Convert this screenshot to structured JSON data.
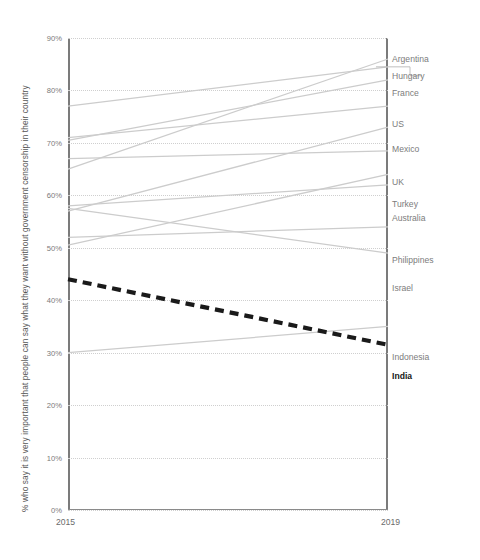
{
  "chart_data": {
    "type": "line",
    "subtype": "slope-chart",
    "title": "",
    "xlabel": "",
    "ylabel": "% who say it is very important that people can say what they want without government censorship in their country",
    "x": [
      "2015",
      "2019"
    ],
    "categories": [
      "2015",
      "2019"
    ],
    "ylim": [
      0,
      90
    ],
    "ytick_labels": [
      "0%",
      "10%",
      "20%",
      "30%",
      "40%",
      "50%",
      "60%",
      "70%",
      "80%",
      "90%"
    ],
    "ytick_values": [
      0,
      10,
      20,
      30,
      40,
      50,
      60,
      70,
      80,
      90
    ],
    "grid": true,
    "grid_style": "dotted",
    "legend": "right-labels",
    "line_color": "#cccccc",
    "highlight_color": "#1a1a1a",
    "series": [
      {
        "name": "Argentina",
        "values": [
          65,
          86
        ],
        "highlight": false
      },
      {
        "name": "Hungary",
        "values": [
          77,
          84.5
        ],
        "highlight": false
      },
      {
        "name": "France",
        "values": [
          70.5,
          82
        ],
        "highlight": false
      },
      {
        "name": "US",
        "values": [
          71,
          77
        ],
        "highlight": false
      },
      {
        "name": "Mexico",
        "values": [
          57,
          73
        ],
        "highlight": false
      },
      {
        "name": "UK",
        "values": [
          67,
          68.5
        ],
        "highlight": false
      },
      {
        "name": "Turkey",
        "values": [
          50.5,
          64
        ],
        "highlight": false
      },
      {
        "name": "Australia",
        "values": [
          58,
          62
        ],
        "highlight": false
      },
      {
        "name": "Philippines",
        "values": [
          52,
          54
        ],
        "highlight": false
      },
      {
        "name": "Israel",
        "values": [
          57.5,
          49
        ],
        "highlight": false
      },
      {
        "name": "Indonesia",
        "values": [
          30,
          35
        ],
        "highlight": false
      },
      {
        "name": "India",
        "values": [
          44,
          31.5
        ],
        "highlight": true
      }
    ],
    "label_positions": [
      {
        "name": "Argentina",
        "y": 86,
        "leader": false
      },
      {
        "name": "Hungary",
        "y": 82.8,
        "leader": true,
        "leader_to": 84.5
      },
      {
        "name": "France",
        "y": 79.6,
        "leader": false
      },
      {
        "name": "US",
        "y": 73.6,
        "leader": false
      },
      {
        "name": "Mexico",
        "y": 68.8,
        "leader": false
      },
      {
        "name": "UK",
        "y": 62.5,
        "leader": false
      },
      {
        "name": "Turkey",
        "y": 58.4,
        "leader": false
      },
      {
        "name": "Australia",
        "y": 55.6,
        "leader": false
      },
      {
        "name": "Philippines",
        "y": 47.6,
        "leader": false
      },
      {
        "name": "Israel",
        "y": 42.4,
        "leader": false
      },
      {
        "name": "Indonesia",
        "y": 29.2,
        "leader": false
      },
      {
        "name": "India",
        "y": 25.6,
        "leader": false
      }
    ]
  },
  "axis": {
    "y_title": "% who say it is very important that people can say what they want without government censorship in their country",
    "x_left": "2015",
    "x_right": "2019"
  }
}
